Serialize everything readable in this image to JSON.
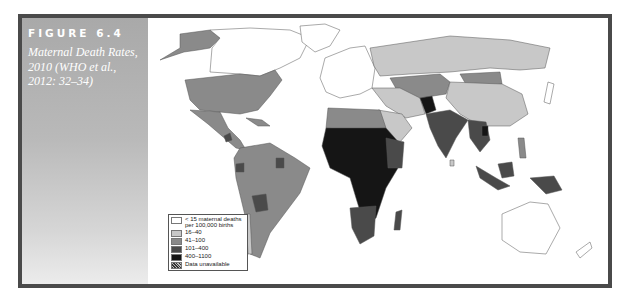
{
  "figure": {
    "label": "FIGURE 6.4",
    "caption": "Maternal Death Rates, 2010 (WHO et al., 2012: 32–34)"
  },
  "legend": {
    "items": [
      {
        "label": "< 15 maternal deaths per 100,000 births",
        "color": "#ffffff"
      },
      {
        "label": "16–40",
        "color": "#c8c8c8"
      },
      {
        "label": "41–100",
        "color": "#8a8a8a"
      },
      {
        "label": "101–400",
        "color": "#4a4a4a"
      },
      {
        "label": "400–1100",
        "color": "#151515"
      },
      {
        "label": "Data unavailable",
        "color": "hatch"
      }
    ]
  },
  "colors": {
    "frame": "#4a4a4a",
    "c0": "#ffffff",
    "c1": "#c8c8c8",
    "c2": "#8a8a8a",
    "c3": "#4a4a4a",
    "c4": "#151515"
  }
}
